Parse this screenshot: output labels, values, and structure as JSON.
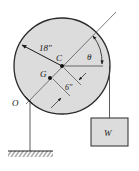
{
  "figure": {
    "labels": {
      "radius": "18″",
      "center": "C",
      "mass_center": "G",
      "pivot": "O",
      "angle": "θ",
      "offset": "6″",
      "weight": "W"
    },
    "colors": {
      "disk_fill": "#dcdcdc",
      "disk_stroke": "#2a2a2a",
      "line": "#333333",
      "box_fill": "#dcdcdc",
      "background": "#ffffff"
    }
  }
}
